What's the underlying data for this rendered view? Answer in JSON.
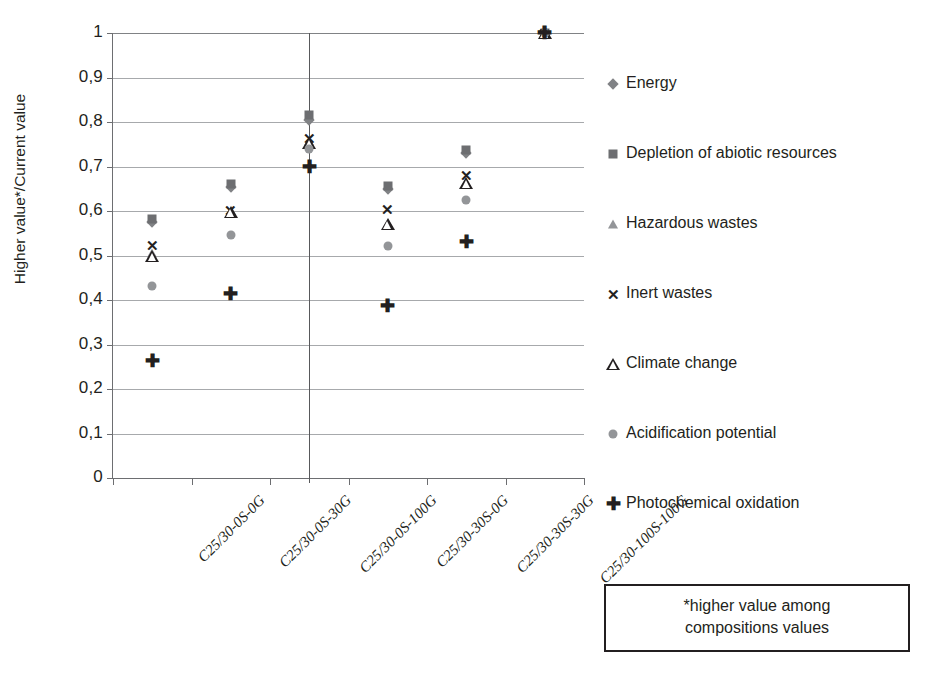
{
  "chart_data": {
    "type": "scatter",
    "title": "",
    "xlabel": "",
    "ylabel": "Higher value*/Current value",
    "ylim": [
      0,
      1
    ],
    "grid": true,
    "legend_position": "right",
    "ytick_labels": [
      "1",
      "0,9",
      "0,8",
      "0,7",
      "0,6",
      "0,5",
      "0,4",
      "0,3",
      "0,2",
      "0,1",
      "0"
    ],
    "ytick_values": [
      1,
      0.9,
      0.8,
      0.7,
      0.6,
      0.5,
      0.4,
      0.3,
      0.2,
      0.1,
      0
    ],
    "categories": [
      "C25/30-0S-0G",
      "C25/30-0S-30G",
      "C25/30-0S-100G",
      "C25/30-30S-0G",
      "C25/30-30S-30G",
      "C25/30-100S-100G"
    ],
    "series": [
      {
        "name": "Energy",
        "marker": "diamond",
        "color": "#808285",
        "values": [
          0.575,
          0.655,
          0.805,
          0.65,
          0.73,
          1.0
        ]
      },
      {
        "name": "Depletion of abiotic resources",
        "marker": "square",
        "color": "#6d6e71",
        "values": [
          0.582,
          0.66,
          0.815,
          0.657,
          0.737,
          1.0
        ]
      },
      {
        "name": "Hazardous wastes",
        "marker": "triangle-filled",
        "color": "#939598",
        "values": [
          0.505,
          0.6,
          0.757,
          0.574,
          0.666,
          1.0
        ]
      },
      {
        "name": "Inert  wastes",
        "marker": "cross",
        "color": "#231f20",
        "values": [
          0.524,
          0.602,
          0.765,
          0.605,
          0.682,
          1.0
        ]
      },
      {
        "name": "Climate change",
        "marker": "triangle-open",
        "color": "#231f20",
        "values": [
          0.498,
          0.597,
          0.752,
          0.571,
          0.663,
          1.0
        ]
      },
      {
        "name": "Acidification potential",
        "marker": "circle",
        "color": "#939598",
        "values": [
          0.432,
          0.545,
          0.74,
          0.522,
          0.625,
          1.0
        ]
      },
      {
        "name": "Photochemical oxidation",
        "marker": "plus",
        "color": "#231f20",
        "values": [
          0.262,
          0.413,
          0.7,
          0.386,
          0.53,
          1.0
        ]
      }
    ],
    "annotations": [
      {
        "name": "vertical-divider",
        "at_category_index": 2
      }
    ]
  },
  "footnote": {
    "line1": "*higher value  among",
    "line2": "compositions values"
  },
  "markers": {
    "diamond": "◆",
    "square": "■",
    "triangle_filled": "▲",
    "cross": "✕",
    "triangle_open": "△",
    "circle": "●",
    "plus": "✚"
  }
}
